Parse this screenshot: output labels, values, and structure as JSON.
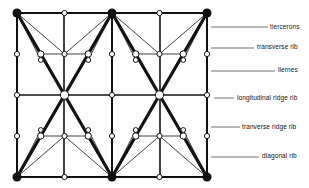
{
  "diagram": {
    "colors": {
      "ink": "#111111",
      "background": "#ffffff",
      "node_fill": "#ffffff"
    },
    "grid": {
      "x": [
        17,
        64,
        112,
        160,
        207
      ],
      "y": [
        13,
        54,
        95,
        136,
        177
      ]
    },
    "labels": [
      {
        "id": "tiercerons",
        "text": "tiercerons",
        "x": 270,
        "y": 24,
        "line_from": [
          211,
          27
        ],
        "line_to": [
          268,
          27
        ]
      },
      {
        "id": "transverse-rib",
        "text": "transverse rib",
        "x": 257,
        "y": 44,
        "line_from": [
          211,
          48
        ],
        "line_to": [
          254,
          48
        ]
      },
      {
        "id": "liernes",
        "text": "liernes",
        "x": 278,
        "y": 67,
        "line_from": [
          211,
          71
        ],
        "line_to": [
          275,
          71
        ]
      },
      {
        "id": "longitudinal-ridge-rib",
        "text": "longitudinal ridge rib",
        "x": 237,
        "y": 95,
        "line_from": [
          214,
          98
        ],
        "line_to": [
          234,
          98
        ]
      },
      {
        "id": "tranverse-ridge-rib",
        "text": "tranverse ridge rib",
        "x": 242,
        "y": 124,
        "line_from": [
          211,
          127
        ],
        "line_to": [
          240,
          127
        ]
      },
      {
        "id": "diagonal-rib",
        "text": "diagonal rib",
        "x": 262,
        "y": 153,
        "line_from": [
          211,
          157
        ],
        "line_to": [
          259,
          157
        ]
      }
    ]
  }
}
